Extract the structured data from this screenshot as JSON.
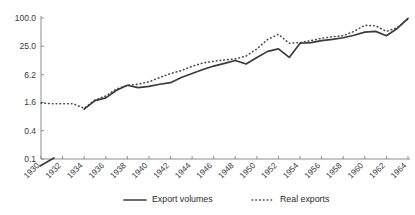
{
  "chart_data": {
    "type": "line",
    "title": "",
    "subtitle": "",
    "xlabel": "",
    "ylabel": "",
    "yscale": "log",
    "ylim": [
      0.1,
      100.0
    ],
    "xlim": [
      1930,
      1964
    ],
    "grid": false,
    "legend_position": "bottom",
    "y_ticks": [
      "100.0",
      "25.0",
      "6.2",
      "1.6",
      "0.4",
      "0.1"
    ],
    "y_tick_values": [
      100.0,
      25.0,
      6.2,
      1.6,
      0.4,
      0.1
    ],
    "x_ticks": [
      "1930",
      "1932",
      "1934",
      "1936",
      "1938",
      "1940",
      "1942",
      "1944",
      "1946",
      "1948",
      "1950",
      "1952",
      "1954",
      "1956",
      "1958",
      "1960",
      "1962",
      "1964"
    ],
    "x_tick_values": [
      1930,
      1932,
      1934,
      1936,
      1938,
      1940,
      1942,
      1944,
      1946,
      1948,
      1950,
      1952,
      1954,
      1956,
      1958,
      1960,
      1962,
      1964
    ],
    "x": [
      1930,
      1931,
      1932,
      1933,
      1934,
      1935,
      1936,
      1937,
      1938,
      1939,
      1940,
      1941,
      1942,
      1943,
      1944,
      1945,
      1946,
      1947,
      1948,
      1949,
      1950,
      1951,
      1952,
      1953,
      1954,
      1955,
      1956,
      1957,
      1958,
      1959,
      1960,
      1961,
      1962,
      1963,
      1964
    ],
    "series": [
      {
        "name": "Export volumes",
        "style": "solid",
        "color": "#3b3b3b",
        "x": [
          1934,
          1935,
          1936,
          1937,
          1938,
          1939,
          1940,
          1941,
          1942,
          1943,
          1944,
          1945,
          1946,
          1947,
          1948,
          1949,
          1950,
          1951,
          1952,
          1953,
          1954,
          1955,
          1956,
          1957,
          1958,
          1959,
          1960,
          1961,
          1962,
          1963,
          1964
        ],
        "values": [
          1.15,
          1.75,
          2.0,
          2.9,
          3.7,
          3.3,
          3.5,
          3.9,
          4.2,
          5.4,
          6.6,
          8.0,
          9.5,
          10.8,
          12.5,
          10.5,
          14.5,
          19.5,
          22.0,
          14.5,
          29.0,
          30.0,
          33.0,
          35.0,
          38.0,
          43.0,
          50.0,
          52.0,
          42.0,
          60.0,
          98.0
        ]
      },
      {
        "name": "Real exports",
        "style": "dotted",
        "color": "#4a4a4a",
        "x": [
          1930,
          1931,
          1932,
          1933,
          1934,
          1935,
          1936,
          1937,
          1938,
          1939,
          1940,
          1941,
          1942,
          1943,
          1944,
          1945,
          1946,
          1947,
          1948,
          1949,
          1950,
          1951,
          1952,
          1953,
          1954,
          1955,
          1956,
          1957,
          1958,
          1959,
          1960,
          1961,
          1962,
          1963,
          1964
        ],
        "values": [
          1.55,
          1.5,
          1.5,
          1.5,
          1.2,
          1.8,
          2.2,
          3.1,
          3.7,
          3.9,
          4.4,
          5.4,
          6.6,
          7.6,
          9.4,
          11.0,
          12.0,
          12.8,
          13.5,
          15.5,
          22.0,
          35.0,
          45.0,
          29.0,
          30.0,
          33.0,
          37.0,
          40.0,
          42.0,
          52.0,
          70.0,
          68.0,
          52.0,
          62.0,
          95.0
        ]
      }
    ],
    "annotations": [
      {
        "name": "origin-stub",
        "description": "short diagonal line fragment near origin between 1930 and 1931 below 0.1"
      }
    ]
  },
  "legend": {
    "items": [
      {
        "label": "Export volumes",
        "style": "solid"
      },
      {
        "label": "Real exports",
        "style": "dotted"
      }
    ]
  },
  "colors": {
    "background": "#ffffff",
    "axis": "#8d8d8d",
    "text": "#2b2b2b",
    "solid_series": "#3b3b3b",
    "dotted_series": "#4a4a4a"
  }
}
